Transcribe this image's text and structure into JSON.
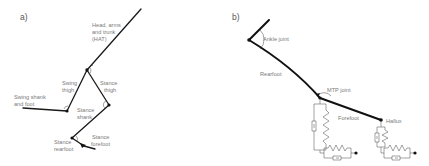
{
  "figure": {
    "panels": [
      {
        "id": "a",
        "label": "a)",
        "title": "Multi-segment leg model",
        "segments": {
          "hat": "Head, arms and trunk (HAT)",
          "swing_thigh": "Swing thigh",
          "swing_shank_foot": "Swing shank and foot",
          "stance_thigh": "Stance thigh",
          "stance_shank": "Stance shank",
          "stance_rearfoot": "Stance rearfoot",
          "stance_forefoot": "Stance forefoot"
        },
        "labels": {
          "hat_line1": "Head, arms",
          "hat_line2": "and trunk",
          "hat_line3": "(HAT)",
          "swing_thigh_line1": "Swing",
          "swing_thigh_line2": "thigh",
          "swing_shank_line1": "Swing shank",
          "swing_shank_line2": "and foot",
          "stance_thigh_line1": "Stance",
          "stance_thigh_line2": "thigh",
          "stance_shank_line1": "Stance",
          "stance_shank_line2": "shank",
          "stance_rearfoot_line1": "Stance",
          "stance_rearfoot_line2": "rearfoot",
          "stance_forefoot_line1": "Stance",
          "stance_forefoot_line2": "forefoot"
        }
      },
      {
        "id": "b",
        "label": "b)",
        "title": "Foot model with ground contact elements",
        "labels": {
          "ankle": "Ankle joint",
          "rearfoot": "Rearfoot",
          "mtp": "MTP joint",
          "forefoot": "Forefoot",
          "hallux": "Hallux"
        }
      }
    ],
    "colors": {
      "segment": "#111111",
      "label_text": "#7a7a7a",
      "background": "#ffffff"
    }
  }
}
